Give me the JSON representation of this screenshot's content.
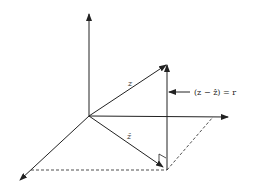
{
  "diagram": {
    "type": "vector-projection-3d",
    "labels": {
      "z_vector": "z",
      "z_hat_vector": "ẑ",
      "residual": "(z − ẑ) = r"
    },
    "colors": {
      "line": "#222222",
      "background": "#ffffff"
    },
    "elements": [
      {
        "name": "vertical-axis",
        "style": "solid-arrow"
      },
      {
        "name": "horizontal-axis",
        "style": "solid-arrow"
      },
      {
        "name": "depth-axis",
        "style": "solid-arrow"
      },
      {
        "name": "z-vector",
        "style": "solid-arrow",
        "label": "z"
      },
      {
        "name": "z-hat-vector",
        "style": "solid-arrow",
        "label": "ẑ"
      },
      {
        "name": "residual-vector",
        "style": "solid-arrow",
        "label": "(z − ẑ) = r"
      },
      {
        "name": "plane-edge-front",
        "style": "dashed"
      },
      {
        "name": "plane-edge-right",
        "style": "dashed"
      },
      {
        "name": "right-angle-marker",
        "style": "solid"
      }
    ]
  }
}
